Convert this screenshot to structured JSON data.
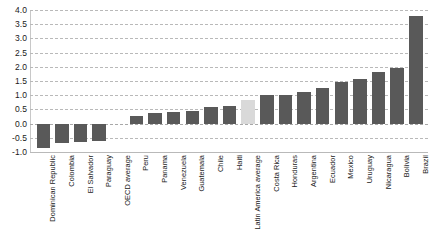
{
  "chart_data": {
    "type": "bar",
    "title": "",
    "subtitle": "",
    "xlabel": "",
    "ylabel": "",
    "ylim": [
      -1.0,
      4.0
    ],
    "grid": true,
    "legend": "none",
    "orientation": "vertical",
    "yticks": [
      "4.0",
      "3.5",
      "3.0",
      "2.5",
      "2.0",
      "1.5",
      "1.0",
      "0.5",
      "0.0",
      "-0.5",
      "-1.0"
    ],
    "ytick_values": [
      4.0,
      3.5,
      3.0,
      2.5,
      2.0,
      1.5,
      1.0,
      0.5,
      0.0,
      -0.5,
      -1.0
    ],
    "categories": [
      "Dominican Republic",
      "Colombia",
      "El Salvador",
      "Paraguay",
      "OECD average",
      "Peru",
      "Panama",
      "Venezuela",
      "Guatemala",
      "Chile",
      "Haiti",
      "Latin America average",
      "Costa Rica",
      "Honduras",
      "Argentina",
      "Ecuador",
      "Mexico",
      "Uruguay",
      "Nicaragua",
      "Bolivia",
      "Brazil"
    ],
    "values": [
      -0.85,
      -0.7,
      -0.65,
      -0.6,
      0.0,
      0.27,
      0.37,
      0.42,
      0.46,
      0.57,
      0.61,
      0.82,
      1.0,
      1.02,
      1.12,
      1.27,
      1.47,
      1.56,
      1.8,
      1.96,
      3.8
    ],
    "highlighted_categories": [
      "Latin America average"
    ],
    "colors": {
      "bar": "#595959",
      "bar_highlight": "#d9d9d9",
      "gridline": "#b9b9b9",
      "axis": "#c8c8c8",
      "text": "#1a1a1a",
      "background": "#ffffff"
    }
  }
}
